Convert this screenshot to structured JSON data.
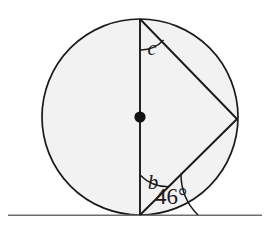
{
  "figure": {
    "canvas": {
      "width": 270,
      "height": 229,
      "background": "#ffffff"
    },
    "style": {
      "stroke_color": "#1a1a1a",
      "circle_fill": "#f2f2f2",
      "baseline_color": "#6e6e6e",
      "stroke_width": 1.6,
      "arc_stroke_width": 1.4
    },
    "circle": {
      "center_x": 140,
      "center_y": 117,
      "radius": 98,
      "center_dot_radius": 5.5,
      "fill": "#f2f2f2"
    },
    "baseline": {
      "x1": 8,
      "y1": 215,
      "x2": 262,
      "y2": 215,
      "label": "tangent-line"
    },
    "points": {
      "top": {
        "x": 140,
        "y": 19,
        "name": "top-point"
      },
      "bottom": {
        "x": 140,
        "y": 215,
        "name": "tangent-point"
      },
      "right": {
        "x": 237,
        "y": 119,
        "name": "right-point"
      },
      "center": {
        "x": 140,
        "y": 117,
        "name": "circle-center"
      }
    },
    "segments": [
      {
        "name": "vertical-diameter",
        "x1": 140,
        "y1": 19,
        "x2": 140,
        "y2": 215
      },
      {
        "name": "upper-chord",
        "x1": 140,
        "y1": 19,
        "x2": 237,
        "y2": 119
      },
      {
        "name": "lower-chord",
        "x1": 140,
        "y1": 215,
        "x2": 237,
        "y2": 119
      }
    ],
    "angles": [
      {
        "name": "angle-c",
        "label": "c",
        "vertex": "top-point",
        "arc_radius": 31,
        "label_x": 152,
        "label_y": 55,
        "font_size": 20
      },
      {
        "name": "angle-b",
        "label": "b",
        "vertex": "tangent-point",
        "arc_radius": 40,
        "label_x": 153,
        "label_y": 188,
        "font_size": 20
      },
      {
        "name": "angle-46",
        "label": "46",
        "degree_symbol": "°",
        "full_label": "46°",
        "vertex": "tangent-point",
        "arc_radius": 58,
        "label_x": 171,
        "label_y": 203,
        "font_size": 22
      }
    ]
  }
}
